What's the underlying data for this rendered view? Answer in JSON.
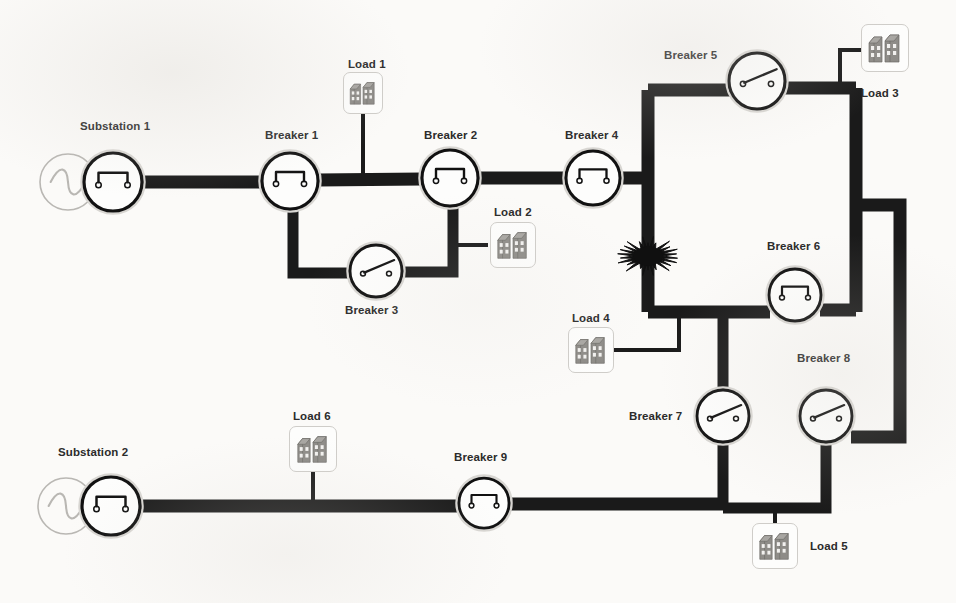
{
  "diagram": {
    "background_color": "#fbfaf8",
    "bus_color": "#1a1a1a",
    "label_color": "#2b2b2b",
    "load_icon_color": "#8e8c88",
    "source_symbol_color": "#b9b7b3"
  },
  "substations": [
    {
      "id": "substation-1",
      "label": "Substation 1",
      "label_x": 80,
      "label_y": 120,
      "source_cx": 68,
      "source_cy": 182,
      "breaker_cx": 113,
      "breaker_cy": 182,
      "state": "closed"
    },
    {
      "id": "substation-2",
      "label": "Substation 2",
      "label_x": 58,
      "label_y": 446,
      "source_cx": 66,
      "source_cy": 506,
      "breaker_cx": 111,
      "breaker_cy": 506,
      "state": "closed"
    }
  ],
  "breakers": [
    {
      "id": "breaker-1",
      "label": "Breaker 1",
      "cx": 290,
      "cy": 181,
      "r": 28,
      "state": "closed",
      "label_x": 265,
      "label_y": 129
    },
    {
      "id": "breaker-2",
      "label": "Breaker 2",
      "cx": 450,
      "cy": 178,
      "r": 28,
      "state": "closed",
      "label_x": 424,
      "label_y": 129
    },
    {
      "id": "breaker-3",
      "label": "Breaker 3",
      "cx": 376,
      "cy": 271,
      "r": 26,
      "state": "open",
      "label_x": 345,
      "label_y": 304
    },
    {
      "id": "breaker-4",
      "label": "Breaker 4",
      "cx": 593,
      "cy": 178,
      "r": 27,
      "state": "closed",
      "label_x": 565,
      "label_y": 129
    },
    {
      "id": "breaker-5",
      "label": "Breaker 5",
      "cx": 757,
      "cy": 81,
      "r": 28,
      "state": "open",
      "label_x": 664,
      "label_y": 49
    },
    {
      "id": "breaker-6",
      "label": "Breaker 6",
      "cx": 795,
      "cy": 295,
      "r": 26,
      "state": "closed",
      "label_x": 767,
      "label_y": 240
    },
    {
      "id": "breaker-7",
      "label": "Breaker 7",
      "cx": 723,
      "cy": 416,
      "r": 26,
      "state": "open",
      "label_x": 629,
      "label_y": 410
    },
    {
      "id": "breaker-8",
      "label": "Breaker 8",
      "cx": 826,
      "cy": 416,
      "r": 26,
      "state": "open",
      "label_x": 797,
      "label_y": 352
    },
    {
      "id": "breaker-9",
      "label": "Breaker 9",
      "cx": 484,
      "cy": 503,
      "r": 25,
      "state": "closed",
      "label_x": 454,
      "label_y": 451
    }
  ],
  "loads": [
    {
      "id": "load-1",
      "label": "Load 1",
      "box_x": 343,
      "box_y": 72,
      "box_w": 40,
      "box_h": 42,
      "label_x": 348,
      "label_y": 58,
      "label_align": "above"
    },
    {
      "id": "load-2",
      "label": "Load 2",
      "box_x": 490,
      "box_y": 222,
      "box_w": 46,
      "box_h": 46,
      "label_x": 494,
      "label_y": 206,
      "label_align": "above"
    },
    {
      "id": "load-3",
      "label": "Load 3",
      "box_x": 861,
      "box_y": 24,
      "box_w": 48,
      "box_h": 48,
      "label_x": 861,
      "label_y": 87,
      "label_align": "below"
    },
    {
      "id": "load-4",
      "label": "Load 4",
      "box_x": 568,
      "box_y": 327,
      "box_w": 46,
      "box_h": 46,
      "label_x": 572,
      "label_y": 312,
      "label_align": "above"
    },
    {
      "id": "load-5",
      "label": "Load 5",
      "box_x": 752,
      "box_y": 523,
      "box_w": 46,
      "box_h": 46,
      "label_x": 810,
      "label_y": 540,
      "label_align": "right"
    },
    {
      "id": "load-6",
      "label": "Load 6",
      "box_x": 289,
      "box_y": 426,
      "box_w": 48,
      "box_h": 46,
      "label_x": 293,
      "label_y": 410,
      "label_align": "above"
    }
  ],
  "fault": {
    "id": "fault-1",
    "symbol": "fault-starburst",
    "cx": 648,
    "cy": 256,
    "radius": 28,
    "color": "#101010"
  },
  "bus_segments": [
    {
      "name": "sub1-to-breaker1",
      "points": "130,182 262,182",
      "width": 13
    },
    {
      "name": "breaker1-to-breaker2",
      "points": "318,180 422,179",
      "width": 13
    },
    {
      "name": "breaker2-to-breaker4",
      "points": "478,178 566,178",
      "width": 13
    },
    {
      "name": "breaker1-down-loop",
      "points": "293,207 293,273 352,273",
      "width": 11
    },
    {
      "name": "breaker3-to-breaker2",
      "points": "401,272 453,272 453,204",
      "width": 11
    },
    {
      "name": "breaker4-to-loop",
      "points": "620,178 652,178",
      "width": 13
    },
    {
      "name": "loop-left-bus",
      "points": "648,90 648,312",
      "width": 13
    },
    {
      "name": "loop-top-left",
      "points": "648,90 730,90",
      "width": 13
    },
    {
      "name": "loop-top-right",
      "points": "785,88 856,88",
      "width": 13
    },
    {
      "name": "loop-right-bus",
      "points": "856,88 856,312",
      "width": 13
    },
    {
      "name": "loop-bottom-left",
      "points": "648,312 770,312",
      "width": 13
    },
    {
      "name": "loop-bottom-right",
      "points": "820,310 856,310",
      "width": 13
    },
    {
      "name": "right-bus-to-outer",
      "points": "856,205 900,205 900,437 851,437",
      "width": 13
    },
    {
      "name": "loop-down-to-breaker7",
      "points": "723,312 723,392",
      "width": 11
    },
    {
      "name": "breaker7-to-bottom-bus",
      "points": "723,442 723,508",
      "width": 11
    },
    {
      "name": "breaker8-to-bottom-bus",
      "points": "826,442 826,508 723,508",
      "width": 11
    },
    {
      "name": "sub2-to-breaker9",
      "points": "130,506 459,506",
      "width": 13
    },
    {
      "name": "breaker9-to-bottom-bus",
      "points": "509,504 723,504",
      "width": 13
    }
  ],
  "tap_lines": [
    {
      "name": "load1-tap",
      "points": "363,114 363,176",
      "width": 4
    },
    {
      "name": "load2-tap",
      "points": "488,245 453,245",
      "width": 4
    },
    {
      "name": "load3-tap",
      "points": "877,72 877,50 840,50 840,88",
      "width": 4
    },
    {
      "name": "load4-tap",
      "points": "614,350 679,350 679,312",
      "width": 4
    },
    {
      "name": "load5-tap",
      "points": "775,523 775,506",
      "width": 4
    },
    {
      "name": "load6-tap",
      "points": "313,472 313,504",
      "width": 4
    }
  ]
}
